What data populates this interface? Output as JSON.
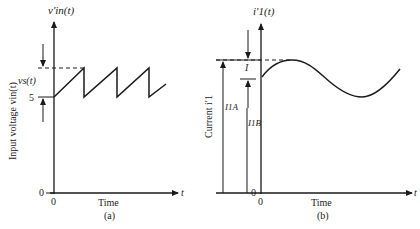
{
  "panel_a": {
    "y_axis_title": "v′in(t)",
    "y_axis_label": "Input voltage vin(t)",
    "x_axis_label": "Time",
    "x_axis_var": "t",
    "tick_5": "5",
    "tick_0_y": "0",
    "tick_0_x": "0",
    "ripple_label": "vs(t)",
    "caption": "(a)",
    "waveform": "sawtooth"
  },
  "panel_b": {
    "y_axis_title": "i′1(t)",
    "y_axis_label": "Current i′1",
    "x_axis_label": "Time",
    "x_axis_var": "t",
    "tick_0_y": "0",
    "tick_0_x": "0",
    "ripple_label": "I",
    "level_a_label": "I1A",
    "level_b_label": "I1B",
    "caption": "(b)",
    "waveform": "sinusoid"
  },
  "colors": {
    "ink": "#1a1a1a",
    "background": "#ffffff"
  }
}
